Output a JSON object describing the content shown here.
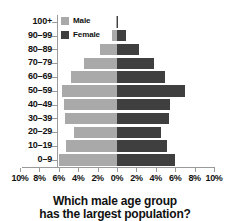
{
  "title": "groups in a population, based on gender.",
  "legend": {
    "position": "top-left-inside",
    "items": [
      {
        "label": "Male",
        "color": "#a9a9a9"
      },
      {
        "label": "Female",
        "color": "#3f3f3f"
      }
    ]
  },
  "question": {
    "line1": "Which male age group",
    "line2": "has the largest population?"
  },
  "colors": {
    "male": "#a9a9a9",
    "female": "#3f3f3f",
    "axis": "#9a9a9a",
    "text": "#111111",
    "background": "#ffffff"
  },
  "chart_data": {
    "type": "bar",
    "subtype": "population-pyramid",
    "title": "groups in a population, based on gender.",
    "xlabel": "",
    "ylabel": "",
    "orientation": "horizontal",
    "grid": false,
    "legend_position": "top-left-inside",
    "xlim": [
      -10,
      10
    ],
    "xticks": [
      -10,
      -8,
      -6,
      -4,
      -2,
      0,
      2,
      4,
      6,
      8,
      10
    ],
    "xtick_labels": [
      "10%",
      "8%",
      "6%",
      "4%",
      "2%",
      "0%",
      "2%",
      "4%",
      "6%",
      "8%",
      "10%"
    ],
    "categories": [
      "100+",
      "90–99",
      "80–89",
      "70–79",
      "60–69",
      "50–59",
      "40–49",
      "30–39",
      "20–29",
      "10–19",
      "0–9"
    ],
    "series": [
      {
        "name": "Male",
        "side": "left",
        "color": "#a9a9a9",
        "values": [
          0.1,
          0.5,
          1.8,
          3.4,
          4.7,
          5.7,
          5.5,
          5.4,
          4.4,
          5.3,
          6.0
        ]
      },
      {
        "name": "Female",
        "side": "right",
        "color": "#3f3f3f",
        "values": [
          0.1,
          0.9,
          2.3,
          3.8,
          4.9,
          7.0,
          5.5,
          5.4,
          4.5,
          5.2,
          6.0
        ]
      }
    ]
  }
}
